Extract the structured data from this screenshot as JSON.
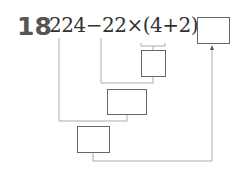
{
  "problem": {
    "number": "18",
    "expression": "224−22×(4+2)=",
    "answer_box_value": "",
    "step_boxes": [
      "",
      "",
      ""
    ]
  }
}
